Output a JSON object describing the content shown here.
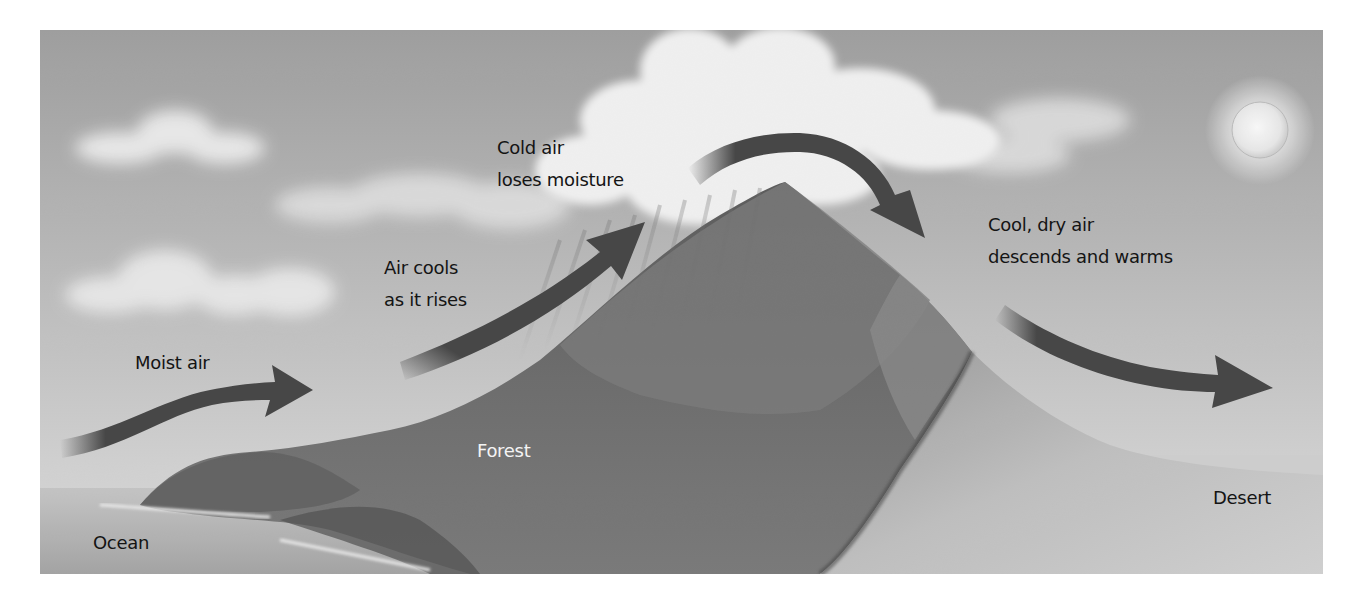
{
  "diagram": {
    "colors": {
      "sky_top": "#a2a2a2",
      "sky_horizon": "#d6d6d6",
      "arrow": "#474747",
      "text_dark": "#141414",
      "text_light": "#f4f4f4",
      "forest": "#6e6e6e",
      "desert": "#c4c4c4",
      "ocean": "#b8b8b8"
    },
    "labels": {
      "moist_air": "Moist air",
      "air_cools_1": "Air cools",
      "air_cools_2": "as it rises",
      "cold_air_1": "Cold air",
      "cold_air_2": "loses moisture",
      "cool_dry_1": "Cool, dry air",
      "cool_dry_2": "descends and warms",
      "forest": "Forest",
      "ocean": "Ocean",
      "desert": "Desert"
    },
    "icons": {
      "sun": "sun-icon",
      "arrows": [
        "moist-air-arrow",
        "rising-air-arrow",
        "over-peak-arrow",
        "descending-air-arrow"
      ]
    },
    "regions": [
      "Ocean",
      "Forest",
      "Mountain",
      "Desert"
    ]
  }
}
